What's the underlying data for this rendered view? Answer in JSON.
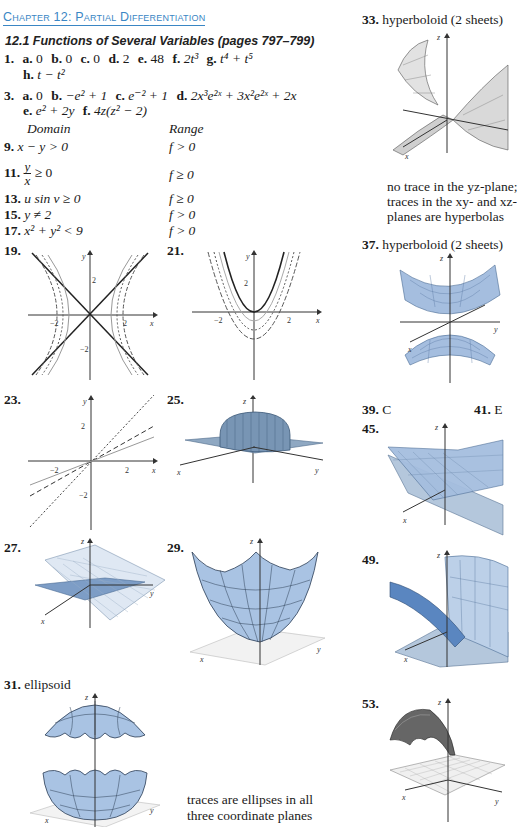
{
  "header": {
    "chapter_title": "Chapter 12: Partial Differentiation",
    "section_title": "12.1 Functions of Several Variables (pages 797–799)"
  },
  "answers": {
    "a1": {
      "number": "1.",
      "parts": [
        {
          "label": "a.",
          "value": "0"
        },
        {
          "label": "b.",
          "value": "0"
        },
        {
          "label": "c.",
          "value": "0"
        },
        {
          "label": "d.",
          "value": "2"
        },
        {
          "label": "e.",
          "value": "48"
        },
        {
          "label": "f.",
          "value": "2t³"
        },
        {
          "label": "g.",
          "value": "t⁴ + t⁵"
        },
        {
          "label": "h.",
          "value": "t − t²"
        }
      ]
    },
    "a3": {
      "number": "3.",
      "parts": [
        {
          "label": "a.",
          "value": "0"
        },
        {
          "label": "b.",
          "value": "−e² + 1"
        },
        {
          "label": "c.",
          "value": "e⁻² + 1"
        },
        {
          "label": "d.",
          "value": "2x³e²ˣ + 3x²e²ˣ + 2x"
        },
        {
          "label": "e.",
          "value": "e² + 2y"
        },
        {
          "label": "f.",
          "value": "4z(z² − 2)"
        }
      ]
    },
    "table_headers": {
      "domain": "Domain",
      "range": "Range"
    },
    "domain_range": [
      {
        "number": "9.",
        "domain": "x − y > 0",
        "range": "f > 0"
      },
      {
        "number": "11.",
        "domain": "y/x ≥ 0",
        "range": "f ≥ 0"
      },
      {
        "number": "13.",
        "domain": "u sin v ≥ 0",
        "range": "f ≥ 0"
      },
      {
        "number": "15.",
        "domain": "y ≠ 2",
        "range": "f > 0"
      },
      {
        "number": "17.",
        "domain": "x² + y² < 9",
        "range": "f > 0"
      }
    ],
    "figures": [
      {
        "number": "19.",
        "type": "2d-level-curves",
        "description": "hyperbolas with asymptotes y = ±x",
        "axis_labels": [
          "x",
          "y"
        ],
        "ticks": [
          "-2",
          "2",
          "-2",
          "2"
        ]
      },
      {
        "number": "21.",
        "type": "2d-level-curves",
        "description": "nested parabolas",
        "axis_labels": [
          "x",
          "y"
        ],
        "ticks": [
          "-2",
          "2",
          "2"
        ]
      },
      {
        "number": "23.",
        "type": "2d-level-curves",
        "description": "lines through origin",
        "axis_labels": [
          "x",
          "y"
        ],
        "ticks": [
          "-2",
          "2",
          "2",
          "-2"
        ]
      },
      {
        "number": "25.",
        "type": "3d-surface",
        "axis_labels": [
          "x",
          "y",
          "z"
        ]
      },
      {
        "number": "27.",
        "type": "3d-surface",
        "axis_labels": [
          "x",
          "y",
          "z"
        ]
      },
      {
        "number": "29.",
        "type": "3d-surface",
        "axis_labels": [
          "x",
          "y",
          "z"
        ]
      },
      {
        "number": "31.",
        "type": "3d-surface",
        "caption": "ellipsoid",
        "note": "traces are ellipses in all three coordinate planes",
        "axis_labels": [
          "x",
          "y",
          "z"
        ]
      },
      {
        "number": "33.",
        "type": "3d-surface",
        "caption": "hyperboloid (2 sheets)",
        "note_lines": [
          "no trace in the yz-plane;",
          "traces in the xy- and xz-",
          "planes are hyperbolas"
        ],
        "axis_labels": [
          "x",
          "z"
        ]
      },
      {
        "number": "37.",
        "type": "3d-surface",
        "caption": "hyperboloid (2 sheets)",
        "axis_labels": [
          "x",
          "y",
          "z"
        ]
      },
      {
        "number": "45.",
        "type": "3d-surface",
        "axis_labels": [
          "x",
          "z"
        ]
      },
      {
        "number": "49.",
        "type": "3d-surface",
        "axis_labels": [
          "x",
          "z"
        ]
      },
      {
        "number": "53.",
        "type": "3d-surface",
        "axis_labels": [
          "x",
          "y",
          "z"
        ]
      }
    ],
    "short": [
      {
        "number": "39.",
        "value": "C"
      },
      {
        "number": "41.",
        "value": "E"
      }
    ]
  },
  "labels": {
    "x": "x",
    "y": "y",
    "z": "z",
    "neg2": "−2",
    "pos2": "2"
  },
  "colors": {
    "chapter_blue": "#3a86c4",
    "surface_blue": "#a9c3e3",
    "surface_dark": "#5b86bf",
    "grid_gray": "#c8c8c8"
  }
}
